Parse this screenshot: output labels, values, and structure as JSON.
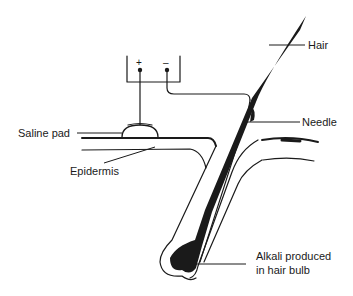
{
  "diagram": {
    "type": "anatomical-illustration",
    "labels": {
      "hair": "Hair",
      "needle": "Needle",
      "saline_pad": "Saline pad",
      "epidermis": "Epidermis",
      "bulb_line1": "Alkali produced",
      "bulb_line2": "in hair bulb"
    },
    "terminals": {
      "positive": "+",
      "negative": "–"
    },
    "colors": {
      "ink": "#1a1a1a",
      "background": "#ffffff"
    }
  }
}
